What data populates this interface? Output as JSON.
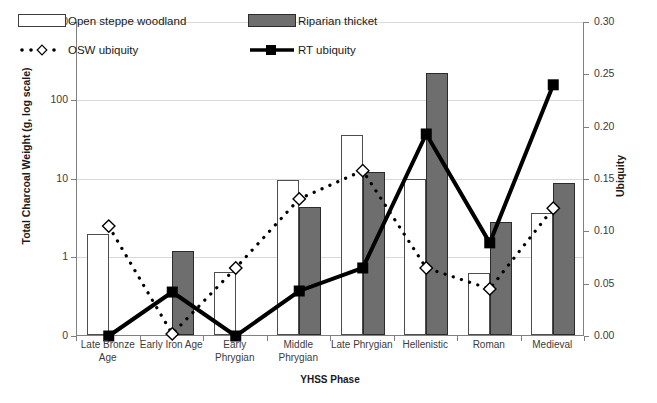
{
  "chart_data": {
    "type": "bar",
    "title": "",
    "xlabel": "YHSS Phase",
    "ylabel": "Total Charcoal Weight (g, log scale)",
    "y2label": "Ubiquity",
    "categories": [
      "Late Bronze Age",
      "Early Iron Age",
      "Early Phrygian",
      "Middle Phrygian",
      "Late Phrygian",
      "Hellenistic",
      "Roman",
      "Medieval"
    ],
    "ylim": [
      0,
      1000
    ],
    "yscale": "log",
    "yticks": [
      "1000",
      "100",
      "10",
      "1",
      "0"
    ],
    "ytick_values": [
      1000,
      100,
      10,
      1,
      0
    ],
    "y2lim": [
      0.0,
      0.3
    ],
    "y2ticks": [
      "0.30",
      "0.25",
      "0.20",
      "0.15",
      "0.10",
      "0.05",
      "0.00"
    ],
    "y2tick_values": [
      0.3,
      0.25,
      0.2,
      0.15,
      0.1,
      0.05,
      0.0
    ],
    "grid": true,
    "legend_position": "upper-left-inside",
    "series": [
      {
        "name": "Open steppe woodland",
        "kind": "bar",
        "axis": "left",
        "color": "#ffffff",
        "edge": "#4d4d4d",
        "values": [
          1.9,
          0.0,
          0.62,
          9.4,
          35.0,
          9.8,
          0.61,
          3.6
        ]
      },
      {
        "name": "Riparian thicket",
        "kind": "bar",
        "axis": "left",
        "color": "#6e6e6e",
        "edge": "#2b2b2b",
        "values": [
          0.0,
          1.15,
          0.0,
          4.2,
          11.8,
          215.0,
          2.7,
          8.5
        ]
      },
      {
        "name": "OSW ubiquity",
        "kind": "line-dotted",
        "axis": "right",
        "color": "#000000",
        "marker": "diamond-open",
        "values": [
          0.105,
          0.002,
          0.065,
          0.131,
          0.158,
          0.065,
          0.045,
          0.122
        ]
      },
      {
        "name": "RT ubiquity",
        "kind": "line-solid",
        "axis": "right",
        "color": "#000000",
        "marker": "square-filled",
        "values": [
          0.0,
          0.042,
          0.0,
          0.043,
          0.065,
          0.193,
          0.089,
          0.24
        ]
      }
    ]
  },
  "legend": {
    "items": [
      {
        "label": "Open steppe woodland",
        "glyph": "bar-open-swatch"
      },
      {
        "label": "Riparian thicket",
        "glyph": "bar-filled-swatch"
      },
      {
        "label": "OSW ubiquity",
        "glyph": "dotted-line-diamond-swatch"
      },
      {
        "label": "RT ubiquity",
        "glyph": "solid-line-square-swatch"
      }
    ]
  },
  "axes": {
    "left_title": "Total Charcoal Weight (g, log scale)",
    "right_title": "Ubiquity",
    "x_title": "YHSS Phase"
  }
}
